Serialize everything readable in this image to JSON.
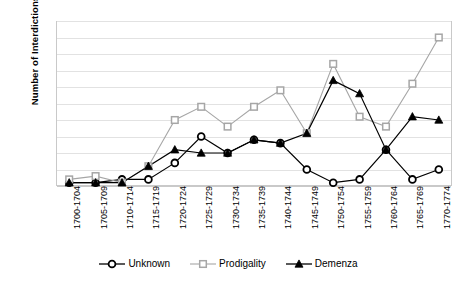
{
  "chart_data": {
    "type": "line",
    "title": "",
    "xlabel": "",
    "ylabel": "Number of Interdictions",
    "ylim": [
      0,
      50
    ],
    "ytick_step": 5,
    "yticks": [
      0,
      5,
      10,
      15,
      20,
      25,
      30,
      35,
      40,
      45,
      50
    ],
    "grid": true,
    "legend_position": "bottom",
    "categories": [
      "1700-1704",
      "1705-1709",
      "1710-1714",
      "1715-1719",
      "1720-1724",
      "1725-1729",
      "1730-1734",
      "1735-1739",
      "1740-1744",
      "1745-1749",
      "1750-1754",
      "1755-1759",
      "1760-1764",
      "1765-1769",
      "1770-1774"
    ],
    "series": [
      {
        "name": "Unknown",
        "marker": "circle",
        "color": "#000000",
        "values": [
          1,
          1,
          2,
          2,
          7,
          15,
          10,
          14,
          13,
          5,
          1,
          2,
          11,
          2,
          5
        ]
      },
      {
        "name": "Prodigality",
        "marker": "square",
        "color": "#a6a6a6",
        "values": [
          2,
          3,
          1,
          6,
          20,
          24,
          18,
          24,
          29,
          16,
          37,
          21,
          18,
          31,
          45
        ]
      },
      {
        "name": "Demenza",
        "marker": "triangle",
        "color": "#000000",
        "values": [
          1,
          1,
          1,
          6,
          11,
          10,
          10,
          14,
          13,
          16,
          32,
          28,
          11,
          21,
          20
        ]
      }
    ]
  },
  "legend": {
    "items": [
      {
        "label": "Unknown"
      },
      {
        "label": "Prodigality"
      },
      {
        "label": "Demenza"
      }
    ]
  },
  "axes": {
    "y_title": "Number of Interdictions"
  }
}
